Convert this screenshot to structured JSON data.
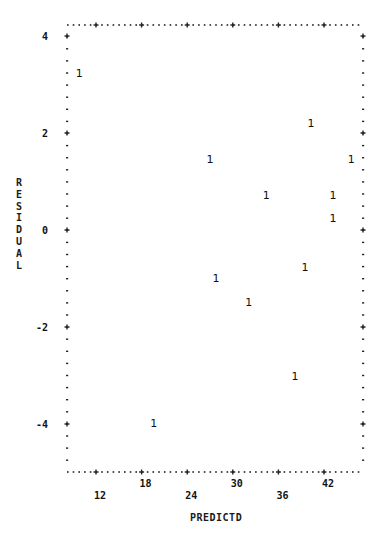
{
  "chart_data": {
    "type": "scatter",
    "title": "",
    "xlabel": "PREDICTD",
    "ylabel": "RESIDUAL",
    "xlim": [
      8.2,
      47.3
    ],
    "ylim": [
      -5.0,
      4.2
    ],
    "x_ticks": [
      12,
      18,
      24,
      30,
      36,
      42
    ],
    "y_ticks": [
      4,
      2,
      0,
      -2,
      -4
    ],
    "x_tick_labels": [
      "12",
      "18",
      "24",
      "30",
      "36",
      "42"
    ],
    "y_tick_labels": [
      "4",
      "2",
      "0",
      "-2",
      "-4"
    ],
    "marker": "1",
    "grid": false,
    "legend": null,
    "series": [
      {
        "name": "residuals",
        "points": [
          {
            "x": 9.8,
            "y": 3.24,
            "label": "1"
          },
          {
            "x": 40.3,
            "y": 2.21,
            "label": "1"
          },
          {
            "x": 27.0,
            "y": 1.46,
            "label": "1"
          },
          {
            "x": 45.6,
            "y": 1.46,
            "label": "1"
          },
          {
            "x": 34.4,
            "y": 0.72,
            "label": "1"
          },
          {
            "x": 43.2,
            "y": 0.72,
            "label": "1"
          },
          {
            "x": 43.2,
            "y": 0.25,
            "label": "1"
          },
          {
            "x": 39.5,
            "y": -0.76,
            "label": "1"
          },
          {
            "x": 27.8,
            "y": -0.99,
            "label": "1"
          },
          {
            "x": 32.1,
            "y": -1.48,
            "label": "1"
          },
          {
            "x": 38.2,
            "y": -3.01,
            "label": "1"
          },
          {
            "x": 19.6,
            "y": -3.98,
            "label": "1"
          }
        ]
      }
    ]
  },
  "axes": {
    "x_title": "PREDICTD",
    "y_title": "RESIDUAL"
  }
}
